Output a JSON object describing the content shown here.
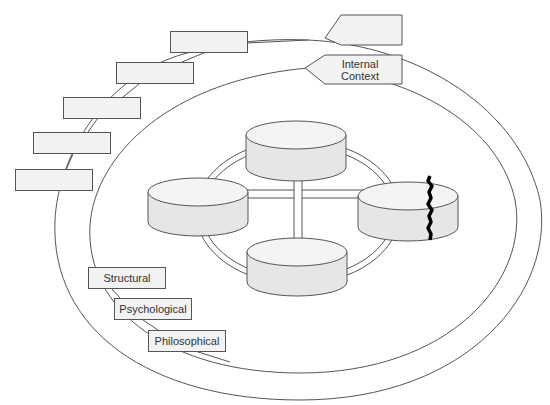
{
  "diagram": {
    "outer_ring": {
      "name": "external-context-ring",
      "label": ""
    },
    "inner_ring": {
      "name": "internal-context-ring",
      "label": "Internal Context"
    },
    "top_callout_label": "",
    "outer_boxes": [
      {
        "label": ""
      },
      {
        "label": ""
      },
      {
        "label": ""
      },
      {
        "label": ""
      },
      {
        "label": ""
      }
    ],
    "inner_boxes": [
      {
        "label": "Structural"
      },
      {
        "label": "Psychological"
      },
      {
        "label": "Philosophical"
      }
    ],
    "cylinders": [
      {
        "position": "top",
        "label": ""
      },
      {
        "position": "left",
        "label": ""
      },
      {
        "position": "right",
        "label": "",
        "cracked": true
      },
      {
        "position": "bottom",
        "label": ""
      }
    ],
    "colors": {
      "stroke": "#555555",
      "cylinder_fill": "#e6e6e6",
      "cylinder_top": "#f4f4f4",
      "box_fill": "#f2f2f2",
      "crack": "#000000"
    }
  }
}
